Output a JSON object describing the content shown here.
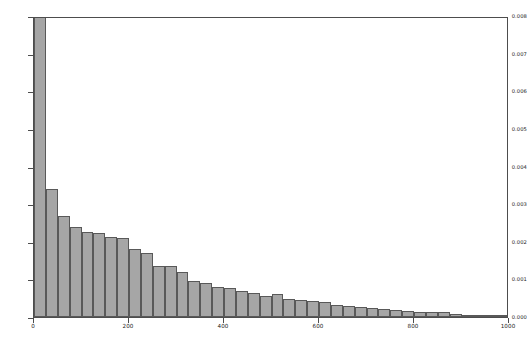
{
  "chart_data": {
    "type": "bar",
    "title": "",
    "subtitle": "",
    "xlabel": "",
    "ylabel": "",
    "xlim": [
      0,
      1000
    ],
    "ylim": [
      0.0,
      0.008
    ],
    "grid": false,
    "legend": null,
    "bin_width": 25,
    "bar_color": "#a6a6a6",
    "bar_edge_color": "#595959",
    "axis_color": "#4d4d4d",
    "background_color": "#ffffff",
    "xticks": [
      0,
      200,
      400,
      600,
      800,
      1000
    ],
    "xtick_labels": [
      "0",
      "200",
      "400",
      "600",
      "800",
      "1000"
    ],
    "yticks": [
      0.0,
      0.001,
      0.002,
      0.003,
      0.004,
      0.005,
      0.006,
      0.007,
      0.008
    ],
    "ytick_labels": [
      "0.000",
      "0.001",
      "0.002",
      "0.003",
      "0.004",
      "0.005",
      "0.006",
      "0.007",
      "0.008"
    ],
    "bin_edges": [
      0,
      25,
      50,
      75,
      100,
      125,
      150,
      175,
      200,
      225,
      250,
      275,
      300,
      325,
      350,
      375,
      400,
      425,
      450,
      475,
      500,
      525,
      550,
      575,
      600,
      625,
      650,
      675,
      700,
      725,
      750,
      775,
      800,
      825,
      850,
      875,
      900,
      925,
      950,
      975,
      1000
    ],
    "bin_centers": [
      12.5,
      37.5,
      62.5,
      87.5,
      112.5,
      137.5,
      162.5,
      187.5,
      212.5,
      237.5,
      262.5,
      287.5,
      312.5,
      337.5,
      362.5,
      387.5,
      412.5,
      437.5,
      462.5,
      487.5,
      512.5,
      537.5,
      562.5,
      587.5,
      612.5,
      637.5,
      662.5,
      687.5,
      712.5,
      737.5,
      762.5,
      787.5,
      812.5,
      837.5,
      862.5,
      887.5,
      912.5,
      937.5,
      962.5,
      987.5
    ],
    "values": [
      0.008,
      0.00341,
      0.00268,
      0.00238,
      0.00226,
      0.00224,
      0.00213,
      0.00211,
      0.0018,
      0.00171,
      0.00135,
      0.00136,
      0.00119,
      0.00095,
      0.0009,
      0.00079,
      0.00078,
      0.00068,
      0.00064,
      0.00057,
      0.00062,
      0.00048,
      0.00044,
      0.00043,
      0.00039,
      0.00031,
      0.00029,
      0.00026,
      0.00025,
      0.00022,
      0.00019,
      0.00016,
      0.00013,
      0.00014,
      0.00014,
      9e-05,
      6e-05,
      5e-05,
      4e-05,
      4e-05
    ]
  }
}
